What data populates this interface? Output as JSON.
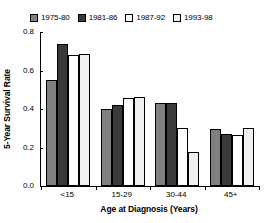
{
  "chart_data": {
    "type": "bar",
    "title": "",
    "subtitle": "",
    "xlabel": "Age at Diagnosis (Years)",
    "ylabel": "5-Year Survival Rate",
    "categories": [
      "<15",
      "15-29",
      "30-44",
      "45+"
    ],
    "series": [
      {
        "name": "1975-80",
        "color": "#808080",
        "values": [
          0.55,
          0.4,
          0.43,
          0.295
        ]
      },
      {
        "name": "1981-86",
        "color": "#3a3a3a",
        "values": [
          0.74,
          0.42,
          0.43,
          0.27
        ]
      },
      {
        "name": "1987-92",
        "color": "#ffffff",
        "values": [
          0.68,
          0.455,
          0.3,
          0.265
        ]
      },
      {
        "name": "1993-98",
        "color": "#f0f0f0",
        "values": [
          0.685,
          0.46,
          0.175,
          0.3
        ]
      }
    ],
    "ylim": [
      0.0,
      0.8
    ],
    "yticks": [
      0.0,
      0.2,
      0.4,
      0.6,
      0.8
    ],
    "ytick_labels": [
      "0.0",
      "0.2",
      "0.4",
      "0.6",
      "0.8"
    ],
    "grid": false,
    "legend_position": "top",
    "annotations": []
  },
  "legend": {
    "entries": [
      {
        "label": "1975-80"
      },
      {
        "label": "1981-86"
      },
      {
        "label": "1987-92"
      },
      {
        "label": "1993-98"
      }
    ]
  },
  "axes": {
    "y_title": "5-Year Survival Rate",
    "x_title": "Age at Diagnosis (Years)"
  }
}
